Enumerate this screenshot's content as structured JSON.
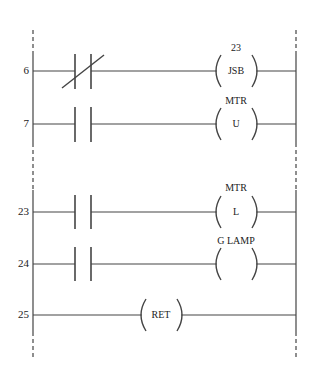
{
  "diagram": {
    "type": "ladder-logic",
    "rails": {
      "left_x": 33,
      "right_x": 296,
      "top_y": 30,
      "bottom_y": 358
    },
    "rungs": [
      {
        "number": "6",
        "contact": "normally-closed",
        "output": {
          "type": "jump-subroutine",
          "above": "23",
          "inside": "JSB"
        }
      },
      {
        "number": "7",
        "contact": "normally-open",
        "output": {
          "type": "coil",
          "above": "MTR",
          "inside": "U"
        }
      },
      {
        "number": "23",
        "contact": "normally-open",
        "output": {
          "type": "coil",
          "above": "MTR",
          "inside": "L"
        }
      },
      {
        "number": "24",
        "contact": "normally-open",
        "output": {
          "type": "coil",
          "above": "G LAMP",
          "inside": ""
        }
      },
      {
        "number": "25",
        "contact": null,
        "output": {
          "type": "return",
          "above": "",
          "inside": "RET"
        }
      }
    ]
  }
}
